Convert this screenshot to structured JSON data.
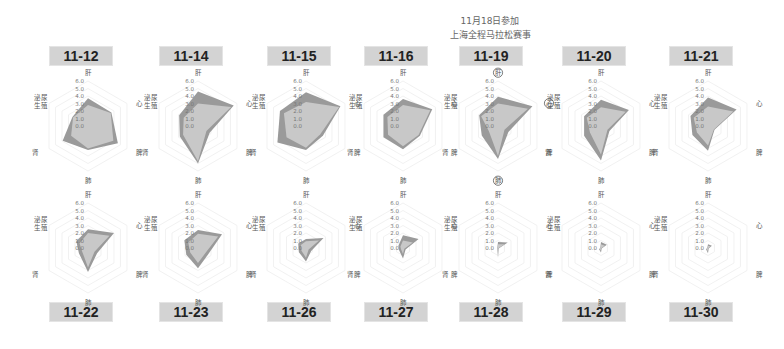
{
  "annotation": {
    "line1": "11月18日参加",
    "line2": "上海全程马拉松赛事"
  },
  "axes": [
    "肝",
    "心",
    "脾",
    "肺",
    "肾",
    "泌尿生殖"
  ],
  "ticks": [
    "6.0",
    "5.0",
    "4.0",
    "3.0",
    "2.0",
    "1.0",
    "0.0"
  ],
  "colors": {
    "outer": "#9a9a9a",
    "inner": "#c8c8c8",
    "grid": "#eeeeee",
    "title_bg": "#d3d3d3"
  },
  "charts": [
    {
      "date": "11-12",
      "outer": [
        3.7,
        3.6,
        4.6,
        3.2,
        3.9,
        2.4
      ],
      "inner": [
        2.8,
        3.5,
        3.9,
        3.0,
        2.6,
        2.3
      ]
    },
    {
      "date": "11-14",
      "outer": [
        4.6,
        5.5,
        1.8,
        5.0,
        2.8,
        2.9
      ],
      "inner": [
        3.0,
        5.1,
        1.3,
        4.7,
        2.3,
        2.2
      ]
    },
    {
      "date": "11-15",
      "outer": [
        4.5,
        5.3,
        2.6,
        3.2,
        4.4,
        4.0
      ],
      "inner": [
        3.2,
        5.1,
        2.2,
        2.9,
        3.0,
        3.4
      ]
    },
    {
      "date": "11-16",
      "outer": [
        3.6,
        4.5,
        2.6,
        3.1,
        3.0,
        3.0
      ],
      "inner": [
        2.8,
        4.2,
        2.4,
        2.7,
        2.3,
        2.4
      ]
    },
    {
      "date": "11-19",
      "outer": [
        3.9,
        5.3,
        1.6,
        4.4,
        2.5,
        2.9
      ],
      "inner": [
        3.0,
        4.6,
        1.0,
        4.0,
        1.4,
        2.6
      ]
    },
    {
      "date": "11-20",
      "outer": [
        3.5,
        4.3,
        1.3,
        4.6,
        2.6,
        2.6
      ],
      "inner": [
        2.5,
        3.8,
        1.0,
        3.8,
        1.7,
        2.2
      ]
    },
    {
      "date": "11-21",
      "outer": [
        3.8,
        4.4,
        1.0,
        3.3,
        2.4,
        2.7
      ],
      "inner": [
        2.6,
        3.9,
        0.9,
        2.6,
        1.7,
        2.2
      ]
    },
    {
      "date": "11-22",
      "outer": [
        2.5,
        4.0,
        1.4,
        3.2,
        1.4,
        1.8
      ],
      "inner": [
        2.0,
        3.3,
        1.0,
        2.6,
        0.9,
        1.3
      ]
    },
    {
      "date": "11-23",
      "outer": [
        2.4,
        3.7,
        1.6,
        2.7,
        1.8,
        2.1
      ],
      "inner": [
        1.9,
        3.1,
        1.2,
        2.0,
        1.2,
        1.5
      ]
    },
    {
      "date": "11-26",
      "outer": [
        1.2,
        2.7,
        0.8,
        1.8,
        1.1,
        1.2
      ],
      "inner": [
        0.9,
        2.0,
        0.4,
        1.3,
        0.7,
        0.8
      ]
    },
    {
      "date": "11-27",
      "outer": [
        1.7,
        2.4,
        0.4,
        1.4,
        0.6,
        0.7
      ],
      "inner": [
        1.0,
        1.5,
        0.2,
        0.8,
        0.3,
        0.4
      ]
    },
    {
      "date": "11-28",
      "outer": [
        0.8,
        1.5,
        0.1,
        1.3,
        0.1,
        0.1
      ],
      "inner": [
        0.5,
        1.0,
        0.05,
        0.9,
        0.05,
        0.05
      ]
    },
    {
      "date": "11-29",
      "outer": [
        0.8,
        0.9,
        0.1,
        0.6,
        0.3,
        0.1
      ],
      "inner": [
        0.5,
        0.6,
        0.05,
        0.4,
        0.2,
        0.05
      ]
    },
    {
      "date": "11-30",
      "outer": [
        0.5,
        0.6,
        0.1,
        0.7,
        0.3,
        0.1
      ],
      "inner": [
        0.3,
        0.4,
        0.05,
        0.5,
        0.2,
        0.05
      ]
    }
  ],
  "chart_data": {
    "type": "radar",
    "title": "11月18日参加 上海全程马拉松赛事",
    "axes": [
      "肝",
      "心",
      "脾",
      "肺",
      "肾",
      "泌尿生殖"
    ],
    "rlim": [
      0,
      6
    ],
    "ticks": [
      0,
      1,
      2,
      3,
      4,
      5,
      6
    ],
    "grid": true,
    "legend": "none",
    "highlighted_axes_on": {
      "date": "11-19",
      "axes": [
        "肝",
        "心",
        "肺"
      ]
    },
    "panels": [
      {
        "title": "11-12",
        "series": [
          {
            "name": "outer",
            "values": [
              3.7,
              3.6,
              4.6,
              3.2,
              3.9,
              2.4
            ]
          },
          {
            "name": "inner",
            "values": [
              2.8,
              3.5,
              3.9,
              3.0,
              2.6,
              2.3
            ]
          }
        ]
      },
      {
        "title": "11-14",
        "series": [
          {
            "name": "outer",
            "values": [
              4.6,
              5.5,
              1.8,
              5.0,
              2.8,
              2.9
            ]
          },
          {
            "name": "inner",
            "values": [
              3.0,
              5.1,
              1.3,
              4.7,
              2.3,
              2.2
            ]
          }
        ]
      },
      {
        "title": "11-15",
        "series": [
          {
            "name": "outer",
            "values": [
              4.5,
              5.3,
              2.6,
              3.2,
              4.4,
              4.0
            ]
          },
          {
            "name": "inner",
            "values": [
              3.2,
              5.1,
              2.2,
              2.9,
              3.0,
              3.4
            ]
          }
        ]
      },
      {
        "title": "11-16",
        "series": [
          {
            "name": "outer",
            "values": [
              3.6,
              4.5,
              2.6,
              3.1,
              3.0,
              3.0
            ]
          },
          {
            "name": "inner",
            "values": [
              2.8,
              4.2,
              2.4,
              2.7,
              2.3,
              2.4
            ]
          }
        ]
      },
      {
        "title": "11-19",
        "series": [
          {
            "name": "outer",
            "values": [
              3.9,
              5.3,
              1.6,
              4.4,
              2.5,
              2.9
            ]
          },
          {
            "name": "inner",
            "values": [
              3.0,
              4.6,
              1.0,
              4.0,
              1.4,
              2.6
            ]
          }
        ]
      },
      {
        "title": "11-20",
        "series": [
          {
            "name": "outer",
            "values": [
              3.5,
              4.3,
              1.3,
              4.6,
              2.6,
              2.6
            ]
          },
          {
            "name": "inner",
            "values": [
              2.5,
              3.8,
              1.0,
              3.8,
              1.7,
              2.2
            ]
          }
        ]
      },
      {
        "title": "11-21",
        "series": [
          {
            "name": "outer",
            "values": [
              3.8,
              4.4,
              1.0,
              3.3,
              2.4,
              2.7
            ]
          },
          {
            "name": "inner",
            "values": [
              2.6,
              3.9,
              0.9,
              2.6,
              1.7,
              2.2
            ]
          }
        ]
      },
      {
        "title": "11-22",
        "series": [
          {
            "name": "outer",
            "values": [
              2.5,
              4.0,
              1.4,
              3.2,
              1.4,
              1.8
            ]
          },
          {
            "name": "inner",
            "values": [
              2.0,
              3.3,
              1.0,
              2.6,
              0.9,
              1.3
            ]
          }
        ]
      },
      {
        "title": "11-23",
        "series": [
          {
            "name": "outer",
            "values": [
              2.4,
              3.7,
              1.6,
              2.7,
              1.8,
              2.1
            ]
          },
          {
            "name": "inner",
            "values": [
              1.9,
              3.1,
              1.2,
              2.0,
              1.2,
              1.5
            ]
          }
        ]
      },
      {
        "title": "11-26",
        "series": [
          {
            "name": "outer",
            "values": [
              1.2,
              2.7,
              0.8,
              1.8,
              1.1,
              1.2
            ]
          },
          {
            "name": "inner",
            "values": [
              0.9,
              2.0,
              0.4,
              1.3,
              0.7,
              0.8
            ]
          }
        ]
      },
      {
        "title": "11-27",
        "series": [
          {
            "name": "outer",
            "values": [
              1.7,
              2.4,
              0.4,
              1.4,
              0.6,
              0.7
            ]
          },
          {
            "name": "inner",
            "values": [
              1.0,
              1.5,
              0.2,
              0.8,
              0.3,
              0.4
            ]
          }
        ]
      },
      {
        "title": "11-28",
        "series": [
          {
            "name": "outer",
            "values": [
              0.8,
              1.5,
              0.1,
              1.3,
              0.1,
              0.1
            ]
          },
          {
            "name": "inner",
            "values": [
              0.5,
              1.0,
              0.05,
              0.9,
              0.05,
              0.05
            ]
          }
        ]
      },
      {
        "title": "11-29",
        "series": [
          {
            "name": "outer",
            "values": [
              0.8,
              0.9,
              0.1,
              0.6,
              0.3,
              0.1
            ]
          },
          {
            "name": "inner",
            "values": [
              0.5,
              0.6,
              0.05,
              0.4,
              0.2,
              0.05
            ]
          }
        ]
      },
      {
        "title": "11-30",
        "series": [
          {
            "name": "outer",
            "values": [
              0.5,
              0.6,
              0.1,
              0.7,
              0.3,
              0.1
            ]
          },
          {
            "name": "inner",
            "values": [
              0.3,
              0.4,
              0.05,
              0.5,
              0.2,
              0.05
            ]
          }
        ]
      }
    ]
  }
}
